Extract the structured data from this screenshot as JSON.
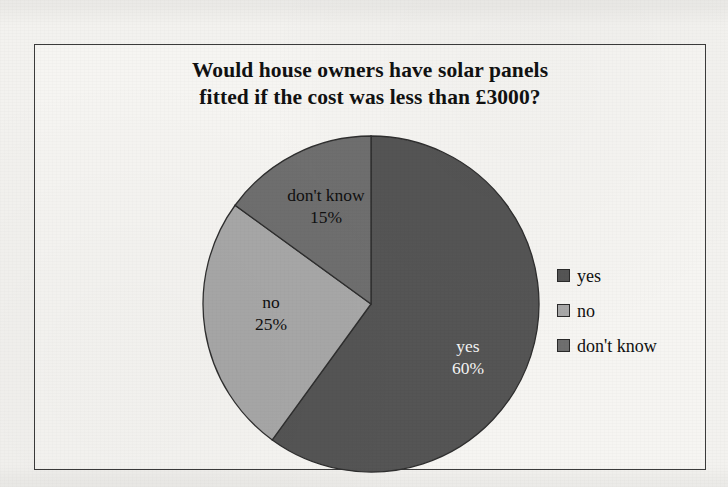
{
  "page": {
    "background_color": "#f3f2ef",
    "frame_border_color": "#3b3b3b"
  },
  "chart_data": {
    "type": "pie",
    "title": "Would house owners have solar panels fitted if the cost was less than £3000?",
    "title_lines": [
      "Would house owners have solar panels",
      "fitted if the cost was less than £3000?"
    ],
    "categories": [
      "yes",
      "no",
      "don't know"
    ],
    "values": [
      60,
      25,
      15
    ],
    "value_unit": "%",
    "colors": [
      "#555555",
      "#a8a8a8",
      "#6f6f6f"
    ],
    "start_angle_deg": 0,
    "direction": "clockwise",
    "legend_position": "right",
    "grid": false,
    "xlabel": "",
    "ylabel": "",
    "slices": [
      {
        "label": "yes",
        "percent_text": "60%",
        "value": 60,
        "color": "#555555",
        "label_color": "#f4f4f4",
        "start_deg": 0,
        "end_deg": 216
      },
      {
        "label": "no",
        "percent_text": "25%",
        "value": 25,
        "color": "#a8a8a8",
        "label_color": "#101010",
        "start_deg": 216,
        "end_deg": 306
      },
      {
        "label": "don't know",
        "percent_text": "15%",
        "value": 15,
        "color": "#6f6f6f",
        "label_color": "#101010",
        "start_deg": 306,
        "end_deg": 360
      }
    ],
    "legend": [
      {
        "label": "yes",
        "color": "#555555"
      },
      {
        "label": "no",
        "color": "#a8a8a8"
      },
      {
        "label": "don't know",
        "color": "#6f6f6f"
      }
    ]
  }
}
